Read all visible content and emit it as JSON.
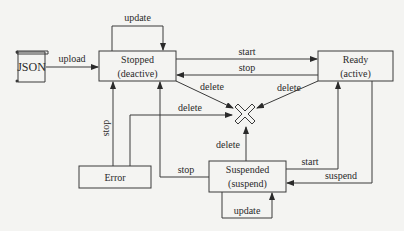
{
  "diagram": {
    "type": "state-transition",
    "nodes": {
      "json": {
        "label": "JSON"
      },
      "stopped": {
        "line1": "Stopped",
        "line2": "(deactive)"
      },
      "ready": {
        "line1": "Ready",
        "line2": "(active)"
      },
      "suspended": {
        "line1": "Suspended",
        "line2": "(suspend)"
      },
      "error": {
        "label": "Error"
      },
      "deleted": {
        "icon": "x-cross-icon"
      }
    },
    "edges": {
      "upload": "upload",
      "stopped_update": "update",
      "start_to_ready": "start",
      "stop_from_ready": "stop",
      "delete_from_stopped": "delete",
      "delete_from_ready": "delete",
      "delete_from_error": "delete",
      "delete_from_suspended": "delete",
      "stop_from_error": "stop",
      "stop_from_suspended": "stop",
      "start_from_suspended": "start",
      "suspend_from_ready": "suspend",
      "suspended_update": "update"
    }
  }
}
